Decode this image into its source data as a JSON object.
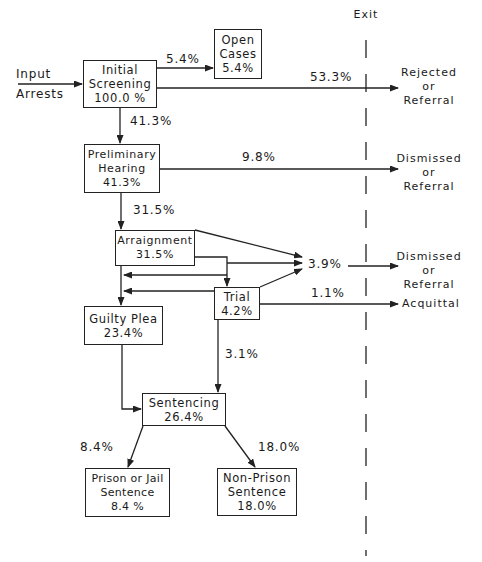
{
  "exit_header": "Exit",
  "input": {
    "line1": "Input",
    "line2": "Arrests"
  },
  "nodes": {
    "initial_screening": {
      "line1": "Initial",
      "line2": "Screening",
      "value": "100.0 %"
    },
    "open_cases": {
      "line1": "Open",
      "line2": "Cases",
      "value": "5.4%"
    },
    "preliminary_hearing": {
      "line1": "Preliminary",
      "line2": "Hearing",
      "value": "41.3%"
    },
    "arraignment": {
      "line1": "Arraignment",
      "value": "31.5%"
    },
    "trial": {
      "line1": "Trial",
      "value": "4.2%"
    },
    "guilty_plea": {
      "line1": "Guilty Plea",
      "value": "23.4%"
    },
    "sentencing": {
      "line1": "Sentencing",
      "value": "26.4%"
    },
    "prison": {
      "line1": "Prison or Jail",
      "line2": "Sentence",
      "value": "8.4 %"
    },
    "non_prison": {
      "line1": "Non-Prison",
      "line2": "Sentence",
      "value": "18.0%"
    }
  },
  "flows": {
    "to_open_cases": "5.4%",
    "rejected": "53.3%",
    "to_preliminary": "41.3%",
    "prelim_dismissed": "9.8%",
    "to_arraignment": "31.5%",
    "arraign_trial_dismissed": "3.9%",
    "acquittal": "1.1%",
    "trial_to_sentencing": "3.1%",
    "to_prison": "8.4%",
    "to_non_prison": "18.0%"
  },
  "exits": {
    "rejected": {
      "line1": "Rejected",
      "line2": "or",
      "line3": "Referral"
    },
    "dismissed1": {
      "line1": "Dismissed",
      "line2": "or",
      "line3": "Referral"
    },
    "dismissed2": {
      "line1": "Dismissed",
      "line2": "or",
      "line3": "Referral"
    },
    "acquittal": {
      "line1": "Acquittal"
    }
  }
}
